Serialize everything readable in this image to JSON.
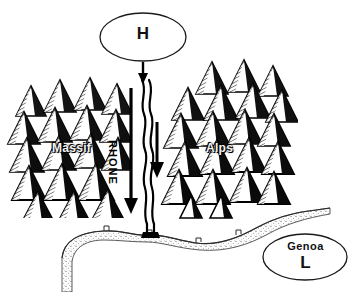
{
  "figure": {
    "type": "schematic-map",
    "title_text": "",
    "background_color": "#ffffff",
    "ink_color": "#000000"
  },
  "pressure_systems": [
    {
      "id": "high",
      "label": "H",
      "kind": "high-pressure",
      "shape": "ellipse",
      "cx": 143,
      "cy": 37,
      "rx": 43,
      "ry": 24
    },
    {
      "id": "low",
      "label": "L",
      "sublabel": "Genoa",
      "kind": "low-pressure",
      "shape": "ellipse",
      "cx": 305,
      "cy": 257,
      "rx": 42,
      "ry": 23
    }
  ],
  "terrain": [
    {
      "id": "massif",
      "label": "Massif",
      "kind": "mountain-range",
      "label_x": 52,
      "label_y": 141
    },
    {
      "id": "alps",
      "label": "Alps",
      "kind": "mountain-range",
      "label_x": 206,
      "label_y": 141
    },
    {
      "id": "coast",
      "label": "",
      "kind": "stippled-coastline"
    }
  ],
  "river": {
    "label": "RHONE",
    "orientation": "vertical-rotated-90",
    "label_x": 119,
    "label_y": 140,
    "mouth_x": 147,
    "mouth_y": 236
  },
  "arrows": [
    {
      "id": "arrow-high-to-valley",
      "from_y": 62,
      "to_y": 82,
      "x": 143,
      "kind": "short-down"
    },
    {
      "id": "arrow-mistral-left",
      "from_y": 88,
      "to_y": 212,
      "x": 131,
      "kind": "long-down"
    },
    {
      "id": "arrow-mistral-right",
      "from_y": 122,
      "to_y": 176,
      "x": 156,
      "kind": "medium-down"
    }
  ],
  "colors": {
    "ink": "#000000",
    "paper": "#ffffff",
    "stipple": "#8a8a8a",
    "mountain_shadow": "#111111",
    "mountain_hatch": "#555555"
  }
}
